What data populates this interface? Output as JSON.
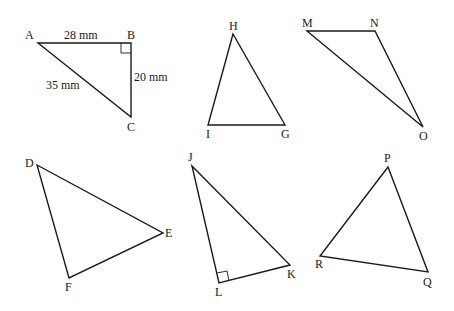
{
  "triangles": [
    {
      "id": "ABC",
      "vertices": {
        "A": [
          38,
          43
        ],
        "B": [
          131,
          43
        ],
        "C": [
          131,
          117
        ]
      },
      "labels": {
        "A": "A",
        "B": "B",
        "C": "C"
      },
      "right_angle_at": "B",
      "side_labels": {
        "AB": "28 mm",
        "BC": "20 mm",
        "AC": "35 mm"
      }
    },
    {
      "id": "HIG",
      "vertices": {
        "H": [
          233,
          34
        ],
        "I": [
          208,
          125
        ],
        "G": [
          285,
          125
        ]
      },
      "labels": {
        "H": "H",
        "I": "I",
        "G": "G"
      }
    },
    {
      "id": "MNO",
      "vertices": {
        "M": [
          307,
          31
        ],
        "N": [
          375,
          31
        ],
        "O": [
          423,
          127
        ]
      },
      "labels": {
        "M": "M",
        "N": "N",
        "O": "O"
      }
    },
    {
      "id": "DEF",
      "vertices": {
        "D": [
          37,
          165
        ],
        "E": [
          163,
          233
        ],
        "F": [
          69,
          278
        ]
      },
      "labels": {
        "D": "D",
        "E": "E",
        "F": "F"
      }
    },
    {
      "id": "JKL",
      "vertices": {
        "J": [
          192,
          166
        ],
        "K": [
          290,
          265
        ],
        "L": [
          219,
          283
        ]
      },
      "labels": {
        "J": "J",
        "K": "K",
        "L": "L"
      },
      "right_angle_at": "L"
    },
    {
      "id": "PQR",
      "vertices": {
        "P": [
          388,
          167
        ],
        "Q": [
          428,
          272
        ],
        "R": [
          320,
          256
        ]
      },
      "labels": {
        "P": "P",
        "Q": "Q",
        "R": "R"
      }
    }
  ]
}
